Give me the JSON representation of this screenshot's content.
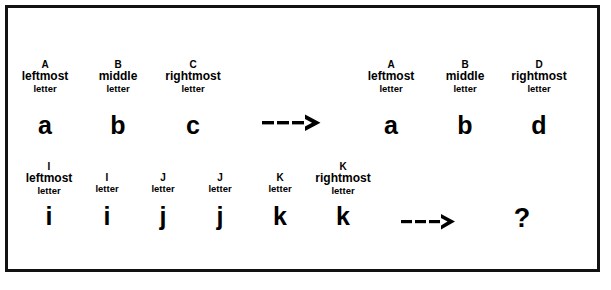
{
  "figure": {
    "background_color": "#ffffff",
    "ink_color": "#000000",
    "border_color": "#121212"
  },
  "rows": [
    {
      "id": "row-top",
      "source": {
        "items": [
          {
            "tag": "A",
            "word": "leftmost",
            "unit": "letter",
            "glyph": "a"
          },
          {
            "tag": "B",
            "word": "middle",
            "unit": "letter",
            "glyph": "b"
          },
          {
            "tag": "C",
            "word": "rightmost",
            "unit": "letter",
            "glyph": "c"
          }
        ]
      },
      "arrow": "--->",
      "target": {
        "items": [
          {
            "tag": "A",
            "word": "leftmost",
            "unit": "letter",
            "glyph": "a"
          },
          {
            "tag": "B",
            "word": "middle",
            "unit": "letter",
            "glyph": "b"
          },
          {
            "tag": "D",
            "word": "rightmost",
            "unit": "letter",
            "glyph": "d"
          }
        ]
      }
    },
    {
      "id": "row-bottom",
      "source": {
        "items": [
          {
            "tag": "I",
            "word": "leftmost",
            "unit": "letter",
            "glyph": "i"
          },
          {
            "tag": "I",
            "word": "",
            "unit": "letter",
            "glyph": "i"
          },
          {
            "tag": "J",
            "word": "",
            "unit": "letter",
            "glyph": "j"
          },
          {
            "tag": "J",
            "word": "",
            "unit": "letter",
            "glyph": "j"
          },
          {
            "tag": "K",
            "word": "",
            "unit": "letter",
            "glyph": "k"
          },
          {
            "tag": "K",
            "word": "rightmost",
            "unit": "letter",
            "glyph": "k"
          }
        ]
      },
      "arrow": "--->",
      "target": {
        "unknown": "?"
      }
    }
  ]
}
